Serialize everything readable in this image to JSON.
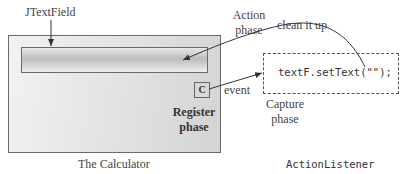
{
  "labels": {
    "jtextfield": "JTextField",
    "action_phase_line1": "Action",
    "action_phase_line2": "phase",
    "clean_it_up": "clean it up",
    "event": "event",
    "register_phase_line1": "Register",
    "register_phase_line2": "phase",
    "capture_phase_line1": "Capture",
    "capture_phase_line2": "phase",
    "calculator_caption": "The Calculator",
    "listener_caption": "ActionListener"
  },
  "calculator": {
    "button_label": "C"
  },
  "listener": {
    "code": "textF.setText(\"\");"
  },
  "colors": {
    "line": "#333333",
    "box_border": "#6a6a6a",
    "panel_gradient_light": "#f2f2f2",
    "panel_gradient_dark": "#d4d4d4"
  }
}
